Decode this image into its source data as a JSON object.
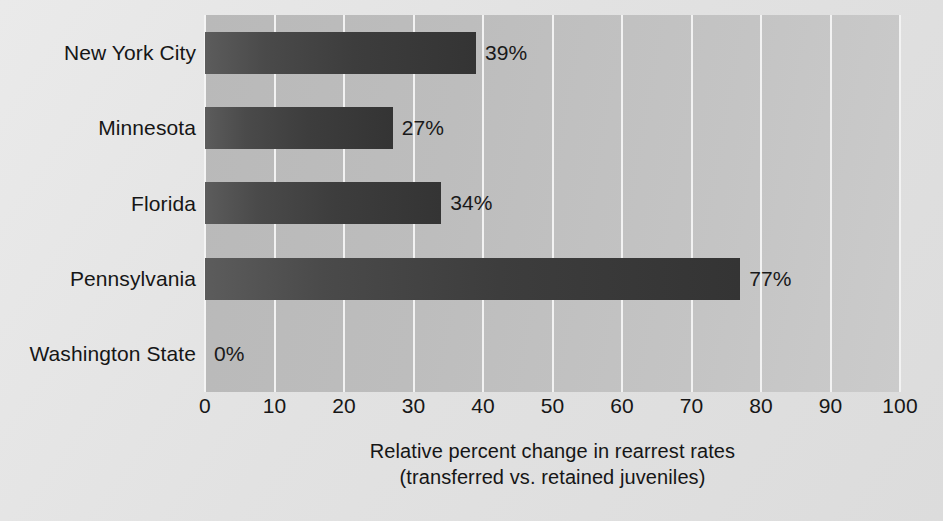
{
  "chart_data": {
    "type": "bar",
    "orientation": "horizontal",
    "title": "",
    "xlabel_line1": "Relative percent change in rearrest rates",
    "xlabel_line2": "(transferred vs. retained juveniles)",
    "ylabel": "",
    "categories": [
      "New York City",
      "Minnesota",
      "Florida",
      "Pennsylvania",
      "Washington State"
    ],
    "values": [
      39,
      27,
      34,
      77,
      0
    ],
    "value_labels": [
      "39%",
      "27%",
      "34%",
      "77%",
      "0%"
    ],
    "xlim": [
      0,
      100
    ],
    "xticks": [
      0,
      10,
      20,
      30,
      40,
      50,
      60,
      70,
      80,
      90,
      100
    ],
    "xtick_labels": [
      "0",
      "10",
      "20",
      "30",
      "40",
      "50",
      "60",
      "70",
      "80",
      "90",
      "100"
    ],
    "grid": "vertical-only",
    "legend": "none",
    "colors": {
      "page_background": "#e3e3e3",
      "plot_background": "#c2c2c2",
      "gridline": "#f2f2f2",
      "bar_start": "#5c5c5c",
      "bar_end": "#343434",
      "text": "#161616"
    }
  }
}
